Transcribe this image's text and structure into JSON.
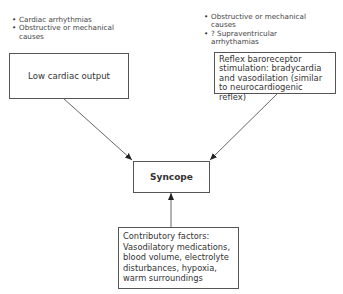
{
  "diagram": {
    "left_cause_bullets": [
      "Cardiac arrhythmias",
      "Obstructive or mechanical causes"
    ],
    "right_cause_bullets": [
      "Obstructive or mechanical causes",
      "? Supraventricular arrhythamias"
    ],
    "left_box": {
      "label": "Low cardiac output"
    },
    "right_box": {
      "label": "Reflex baroreceptor stimulation: bradycardia and vasodilation (similar to neurocardiogenic reflex)"
    },
    "center_box": {
      "label": "Syncope"
    },
    "bottom_box": {
      "label": "Contributory factors: Vasodilatory medications, blood volume, electrolyte disturbances, hypoxia, warm surroundings"
    },
    "edges": [
      {
        "from": "Low cardiac output",
        "to": "Syncope"
      },
      {
        "from": "Reflex baroreceptor stimulation",
        "to": "Syncope"
      },
      {
        "from": "Contributory factors",
        "to": "Syncope"
      }
    ],
    "colors": {
      "line": "#555555",
      "text": "#333333",
      "background": "#ffffff"
    }
  }
}
